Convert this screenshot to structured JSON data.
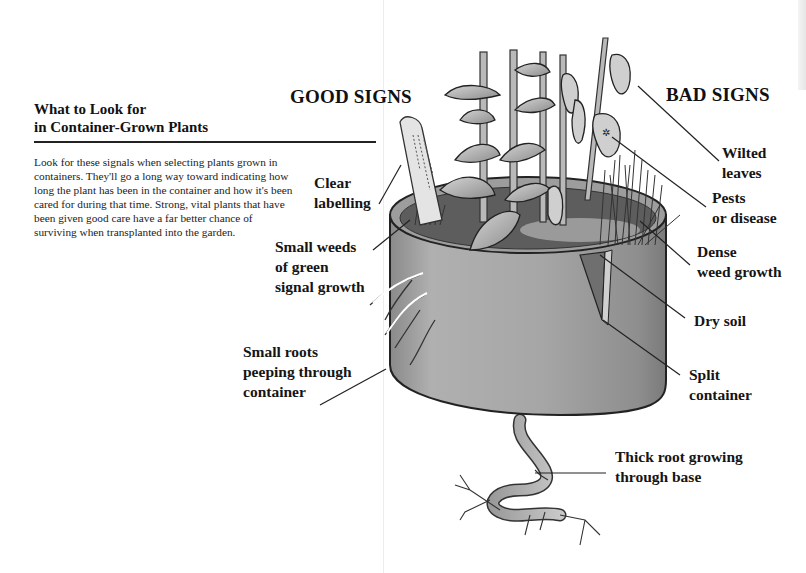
{
  "sidebar": {
    "title_line1": "What to Look for",
    "title_line2": "in Container-Grown Plants",
    "body": "Look for these signals when selecting plants grown in containers. They'll go a long way toward indicating how long the plant has been in the container and how it's been cared for during that time. Strong, vital plants that have been given good care have a far better chance of surviving when transplanted into the garden."
  },
  "illustration": {
    "subject": "container-grown plant in pot with roots",
    "good_signs": {
      "heading": "GOOD SIGNS",
      "callouts": [
        {
          "id": "clear-labelling",
          "text": "Clear\nlabelling"
        },
        {
          "id": "small-weeds",
          "text": "Small weeds\nof green\nsignal growth"
        },
        {
          "id": "small-roots",
          "text": "Small roots\npeeping through\ncontainer"
        }
      ]
    },
    "bad_signs": {
      "heading": "BAD SIGNS",
      "callouts": [
        {
          "id": "wilted-leaves",
          "text": "Wilted\nleaves"
        },
        {
          "id": "pests-disease",
          "text": "Pests\nor disease"
        },
        {
          "id": "dense-weed",
          "text": "Dense\nweed growth"
        },
        {
          "id": "dry-soil",
          "text": "Dry soil"
        },
        {
          "id": "split-container",
          "text": "Split\ncontainer"
        },
        {
          "id": "thick-root",
          "text": "Thick root growing\nthrough base"
        }
      ]
    }
  }
}
